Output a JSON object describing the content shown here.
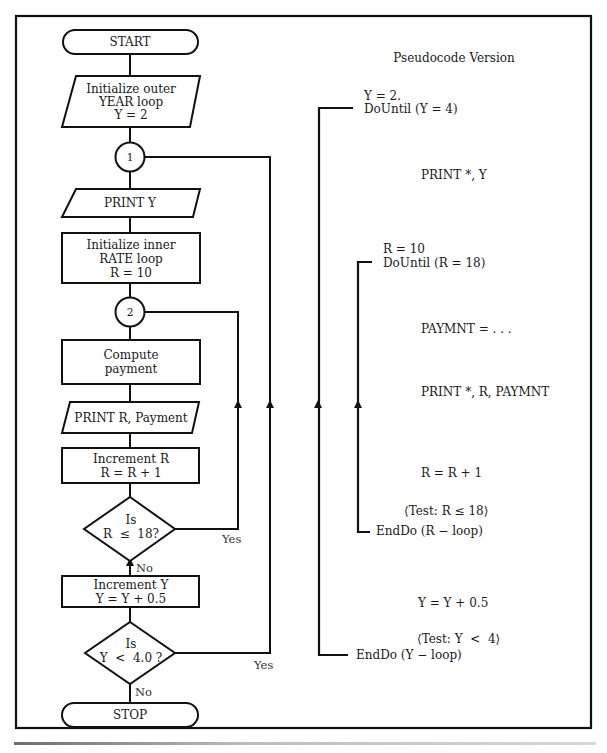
{
  "flowchart": {
    "start": "START",
    "init_outer": [
      "Initialize outer",
      "YEAR loop",
      "Y = 2"
    ],
    "connector_1": "1",
    "print_y": "PRINT Y",
    "init_inner": [
      "Initialize inner",
      "RATE loop",
      "R = 10"
    ],
    "connector_2": "2",
    "compute": [
      "Compute",
      "payment"
    ],
    "print_r": "PRINT R, Payment",
    "increment_r": [
      "Increment R",
      "R = R + 1"
    ],
    "decision_r": [
      "Is",
      "R  ≤  18?"
    ],
    "decision_r_yes": "Yes",
    "decision_r_no": "No",
    "increment_y": [
      "Increment Y",
      "Y = Y + 0.5"
    ],
    "decision_y": [
      "Is",
      "Y  <  4.0 ?"
    ],
    "decision_y_yes": "Yes",
    "decision_y_no": "No",
    "stop": "STOP"
  },
  "pseudocode": {
    "title": "Pseudocode Version",
    "lines": {
      "y_init": "Y = 2.",
      "y_dountil": "DoUntil (Y = 4)",
      "print_y": "PRINT *, Y",
      "r_init": "R = 10",
      "r_dountil": "DoUntil (R = 18)",
      "paymnt": "PAYMNT = . . .",
      "print_r": "PRINT *, R, PAYMNT",
      "r_inc": "R = R + 1",
      "r_test": "⟨Test: R ≤ 18⟩",
      "r_enddo": "EndDo (R − loop)",
      "y_inc": "Y = Y + 0.5",
      "y_test": "⟨Test: Y  <  4⟩",
      "y_enddo": "EndDo (Y − loop)"
    }
  },
  "colors": {
    "stroke": "#111111",
    "text": "#1a1a1a",
    "background": "#ffffff"
  }
}
